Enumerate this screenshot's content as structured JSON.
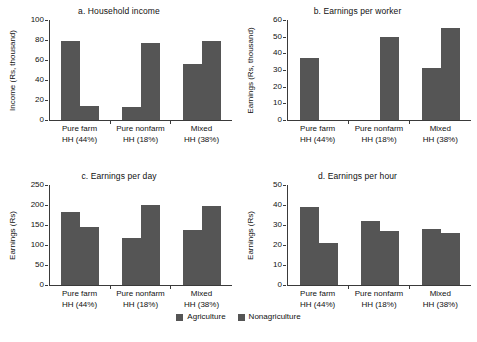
{
  "legend": {
    "items": [
      {
        "label": "Agriculture",
        "color": "#555555"
      },
      {
        "label": "Nonagriculture",
        "color": "#555555"
      }
    ]
  },
  "source_note": "",
  "categories": [
    "Pure farm\nHH (44%)",
    "Pure nonfarm\nHH (18%)",
    "Mixed\nHH (38%)"
  ],
  "category_lines": [
    {
      "line1": "Pure farm",
      "line2": "HH (44%)"
    },
    {
      "line1": "Pure nonfarm",
      "line2": "HH (18%)"
    },
    {
      "line1": "Mixed",
      "line2": "HH (38%)"
    }
  ],
  "chart_data": [
    {
      "id": "a",
      "type": "bar",
      "title": "a. Household income",
      "ylabel": "Income (Rs, thousand)",
      "xlabel": "",
      "categories": [
        "Pure farm HH (44%)",
        "Pure nonfarm HH (18%)",
        "Mixed HH (38%)"
      ],
      "ylim": [
        0,
        100
      ],
      "yticks": [
        0,
        20,
        40,
        60,
        80,
        100
      ],
      "grid": false,
      "legend_position": "bottom",
      "series": [
        {
          "name": "Agriculture",
          "values": [
            79,
            13,
            56
          ]
        },
        {
          "name": "Nonagriculture",
          "values": [
            14,
            77,
            79
          ]
        }
      ]
    },
    {
      "id": "b",
      "type": "bar",
      "title": "b. Earnings per worker",
      "ylabel": "Earnings (Rs, thousand)",
      "xlabel": "",
      "categories": [
        "Pure farm HH (44%)",
        "Pure nonfarm HH (18%)",
        "Mixed HH (38%)"
      ],
      "ylim": [
        0,
        60
      ],
      "yticks": [
        0,
        10,
        20,
        30,
        40,
        50,
        60
      ],
      "grid": false,
      "legend_position": "bottom",
      "series": [
        {
          "name": "Agriculture",
          "values": [
            37,
            null,
            31
          ]
        },
        {
          "name": "Nonagriculture",
          "values": [
            null,
            50,
            55
          ]
        }
      ]
    },
    {
      "id": "c",
      "type": "bar",
      "title": "c. Earnings per day",
      "ylabel": "Earnings (Rs)",
      "xlabel": "",
      "categories": [
        "Pure farm HH (44%)",
        "Pure nonfarm HH (18%)",
        "Mixed HH (38%)"
      ],
      "ylim": [
        0,
        250
      ],
      "yticks": [
        0,
        50,
        100,
        150,
        200,
        250
      ],
      "grid": false,
      "legend_position": "bottom",
      "series": [
        {
          "name": "Agriculture",
          "values": [
            182,
            118,
            138
          ]
        },
        {
          "name": "Nonagriculture",
          "values": [
            145,
            201,
            198
          ]
        }
      ]
    },
    {
      "id": "d",
      "type": "bar",
      "title": "d. Earnings per hour",
      "ylabel": "Earnings (Rs)",
      "xlabel": "",
      "categories": [
        "Pure farm HH (44%)",
        "Pure nonfarm HH (18%)",
        "Mixed HH (38%)"
      ],
      "ylim": [
        0,
        50
      ],
      "yticks": [
        0,
        10,
        20,
        30,
        40,
        50
      ],
      "grid": false,
      "legend_position": "bottom",
      "series": [
        {
          "name": "Agriculture",
          "values": [
            39,
            32,
            28
          ]
        },
        {
          "name": "Nonagriculture",
          "values": [
            21,
            27,
            26
          ]
        }
      ]
    }
  ]
}
